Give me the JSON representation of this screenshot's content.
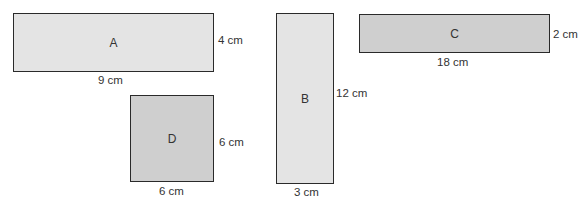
{
  "diagram": {
    "shapes": [
      {
        "id": "A",
        "label": "A",
        "width": "9 cm",
        "height": "4 cm",
        "fill": "#e4e4e4"
      },
      {
        "id": "B",
        "label": "B",
        "width": "3 cm",
        "height": "12 cm",
        "fill": "#e4e4e4"
      },
      {
        "id": "C",
        "label": "C",
        "width": "18 cm",
        "height": "2 cm",
        "fill": "#cfcfcf"
      },
      {
        "id": "D",
        "label": "D",
        "width": "6 cm",
        "height": "6 cm",
        "fill": "#cfcfcf"
      }
    ]
  }
}
